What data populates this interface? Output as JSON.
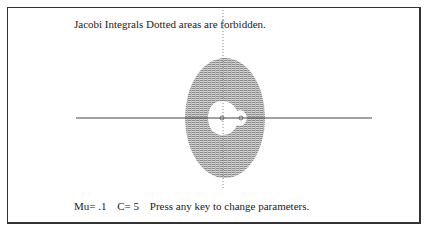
{
  "title": "Jacobi Integrals  Dotted areas are forbidden.",
  "status": {
    "mu_label": "Mu= .1",
    "c_label": "C= 5",
    "prompt": "Press any key to change parameters."
  },
  "colors": {
    "frame": "#333333",
    "forbidden_fill": "#9a9a9a",
    "axis": "#444444",
    "text": "#222222"
  },
  "plot": {
    "x_axis": {
      "x1": 76,
      "x2": 372,
      "y": 118
    },
    "y_axis": {
      "x": 223,
      "y1": 10,
      "y2": 190
    },
    "forbidden_region": {
      "cx": 225,
      "cy": 118,
      "rx": 40,
      "ry": 60
    },
    "masses": [
      {
        "cx": 222,
        "cy": 118
      },
      {
        "cx": 241,
        "cy": 118
      }
    ]
  }
}
